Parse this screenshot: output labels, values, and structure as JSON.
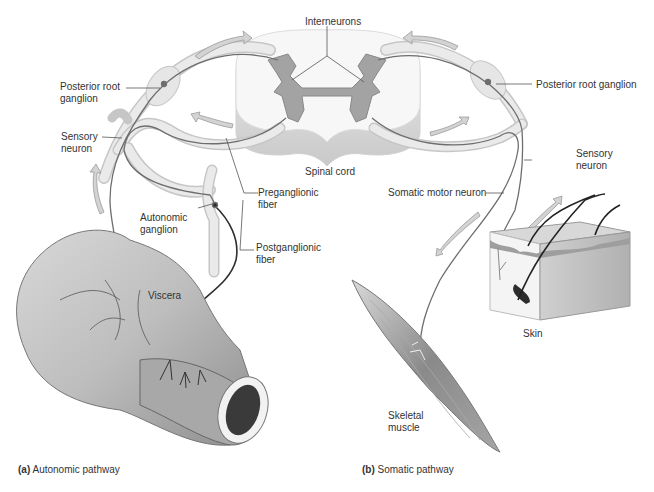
{
  "figure": {
    "panels": [
      {
        "letter": "(a)",
        "title": "Autonomic pathway"
      },
      {
        "letter": "(b)",
        "title": "Somatic pathway"
      }
    ]
  },
  "labels": {
    "interneurons": "Interneurons",
    "posterior_root_ganglion_left_1": "Posterior root",
    "posterior_root_ganglion_left_2": "ganglion",
    "posterior_root_ganglion_right": "Posterior root ganglion",
    "sensory_neuron_left_1": "Sensory",
    "sensory_neuron_left_2": "neuron",
    "sensory_neuron_right_1": "Sensory",
    "sensory_neuron_right_2": "neuron",
    "spinal_cord": "Spinal cord",
    "preganglionic_1": "Preganglionic",
    "preganglionic_2": "fiber",
    "autonomic_ganglion_1": "Autonomic",
    "autonomic_ganglion_2": "ganglion",
    "postganglionic_1": "Postganglionic",
    "postganglionic_2": "fiber",
    "viscera": "Viscera",
    "somatic_motor_neuron": "Somatic motor neuron",
    "skin": "Skin",
    "skeletal_muscle_1": "Skeletal",
    "skeletal_muscle_2": "muscle"
  },
  "colors": {
    "background": "#ffffff",
    "nerve_fill": "#e6e6e6",
    "nerve_outline": "#c8c8c8",
    "neuron_line": "#6e6e6e",
    "gray_matter": "#9a9a9a",
    "arrow_fill": "#cfcfcf",
    "label_text": "#333333",
    "leader_line": "#555555"
  }
}
